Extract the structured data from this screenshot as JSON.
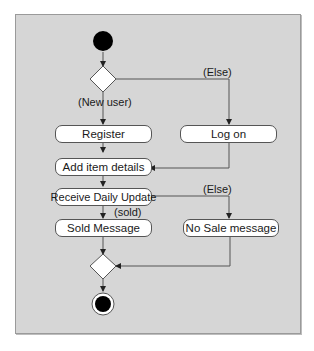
{
  "diagram": {
    "type": "uml-activity",
    "colors": {
      "background": "#d6d6d6",
      "node_fill": "#ffffff",
      "line": "#555555",
      "start": "#000000"
    },
    "nodes": {
      "register": "Register",
      "log_on": "Log on",
      "add_item": "Add item details",
      "receive_update": "Receive Daily Update",
      "sold_message": "Sold Message",
      "no_sale": "No Sale message"
    },
    "guards": {
      "else_top": "(Else)",
      "new_user": "(New user)",
      "else_mid": "(Else)",
      "sold": "(sold)"
    },
    "edges": [
      [
        "start",
        "decision1"
      ],
      [
        "decision1",
        "register",
        "(New user)"
      ],
      [
        "decision1",
        "log_on",
        "(Else)"
      ],
      [
        "register",
        "add_item"
      ],
      [
        "log_on",
        "add_item"
      ],
      [
        "add_item",
        "receive_update"
      ],
      [
        "receive_update",
        "sold_message",
        "(sold)"
      ],
      [
        "receive_update",
        "no_sale",
        "(Else)"
      ],
      [
        "sold_message",
        "merge"
      ],
      [
        "no_sale",
        "merge"
      ],
      [
        "merge",
        "end"
      ]
    ]
  }
}
